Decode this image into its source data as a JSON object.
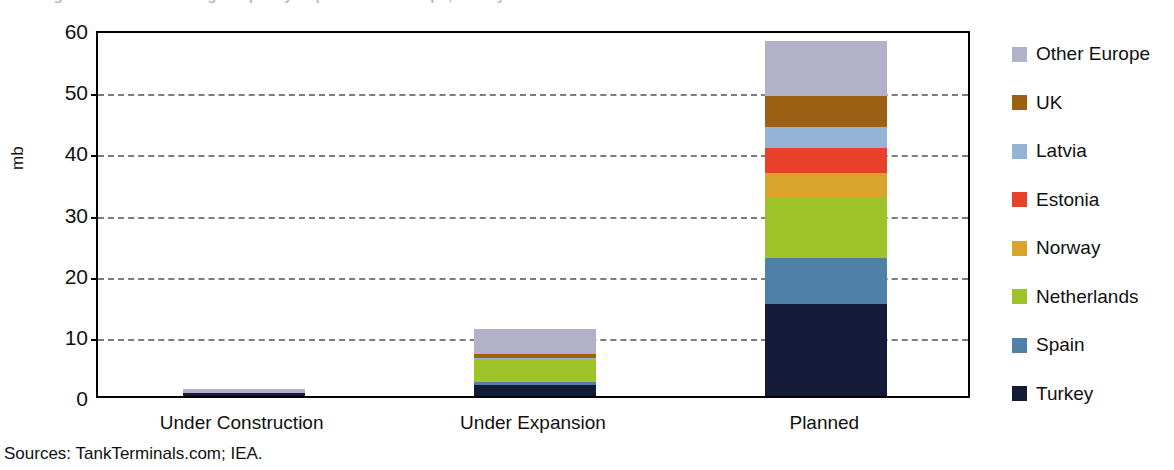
{
  "title": "Figure: Crude Oil Storage Capacity Expansion in Europe, Turkey and the Baltics",
  "yaxis_title": "mb",
  "sources": "Sources: TankTerminals.com; IEA.",
  "legend": {
    "items": [
      {
        "label": "Other Europe",
        "color": "#b3b0c9"
      },
      {
        "label": "UK",
        "color": "#9c6112"
      },
      {
        "label": "Latvia",
        "color": "#95b3d7"
      },
      {
        "label": "Estonia",
        "color": "#e8402a"
      },
      {
        "label": "Norway",
        "color": "#d9a42c"
      },
      {
        "label": "Netherlands",
        "color": "#9dc328"
      },
      {
        "label": "Spain",
        "color": "#4f81a8"
      },
      {
        "label": "Turkey",
        "color": "#141b38"
      }
    ]
  },
  "chart_data": {
    "type": "bar",
    "subtype": "stacked",
    "title": "Figure: Crude Oil Storage Capacity Expansion in Europe, Turkey and the Baltics",
    "xlabel": "",
    "ylabel": "mb",
    "ylim": [
      0,
      60
    ],
    "yticks": [
      0,
      10,
      20,
      30,
      40,
      50,
      60
    ],
    "grid": "horizontal-dashed",
    "legend_position": "right",
    "categories": [
      "Under Construction",
      "Under Expansion",
      "Planned"
    ],
    "series": [
      {
        "name": "Turkey",
        "color": "#141b38",
        "values": [
          0.5,
          1.8,
          15.0
        ]
      },
      {
        "name": "Spain",
        "color": "#4f81a8",
        "values": [
          0.0,
          0.5,
          7.5
        ]
      },
      {
        "name": "Netherlands",
        "color": "#9dc328",
        "values": [
          0.0,
          3.8,
          10.0
        ]
      },
      {
        "name": "Norway",
        "color": "#d9a42c",
        "values": [
          0.0,
          0.0,
          4.0
        ]
      },
      {
        "name": "Estonia",
        "color": "#e8402a",
        "values": [
          0.0,
          0.0,
          4.0
        ]
      },
      {
        "name": "Latvia",
        "color": "#95b3d7",
        "values": [
          0.0,
          0.2,
          3.5
        ]
      },
      {
        "name": "UK",
        "color": "#9c6112",
        "values": [
          0.0,
          0.5,
          5.0
        ]
      },
      {
        "name": "Other Europe",
        "color": "#b3b0c9",
        "values": [
          0.6,
          4.2,
          9.0
        ]
      }
    ],
    "totals": [
      1.1,
      11.0,
      58.0
    ]
  }
}
